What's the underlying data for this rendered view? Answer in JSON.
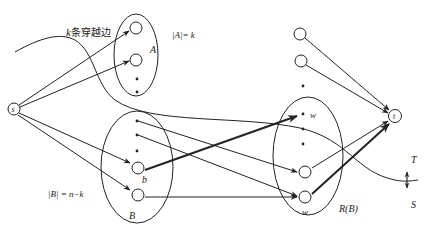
{
  "diagram": {
    "type": "flow-network-cut",
    "labels": {
      "crossing_edges": "k条穿越边",
      "k_prefix": "k",
      "crossing_text": "条穿越边",
      "set_A_size": "|A|= k",
      "set_A": "A",
      "set_B_size": "|B| = n−k",
      "set_B": "B",
      "node_b": "b",
      "node_w_top": "w",
      "node_w_bottom": "w",
      "set_RB": "R(B)",
      "source": "s",
      "sink": "t",
      "side_T": "T",
      "side_S": "S"
    },
    "nodes": [
      {
        "id": "s",
        "label": "s"
      },
      {
        "id": "A1",
        "set": "A"
      },
      {
        "id": "A2",
        "set": "A"
      },
      {
        "id": "B_b",
        "set": "B",
        "label": "b"
      },
      {
        "id": "B_low",
        "set": "B"
      },
      {
        "id": "top1"
      },
      {
        "id": "top2"
      },
      {
        "id": "R_w_dot",
        "set": "R(B)",
        "label": "w"
      },
      {
        "id": "R1",
        "set": "R(B)"
      },
      {
        "id": "R_w",
        "set": "R(B)",
        "label": "w"
      },
      {
        "id": "t",
        "label": "t"
      }
    ],
    "edges": [
      {
        "from": "s",
        "to": "A1"
      },
      {
        "from": "s",
        "to": "A2"
      },
      {
        "from": "s",
        "to": "B_b"
      },
      {
        "from": "s",
        "to": "B_low"
      },
      {
        "from": "B_b",
        "to": "R_w_dot",
        "bold": true
      },
      {
        "from": "B_dot1",
        "to": "R1"
      },
      {
        "from": "B_dot2",
        "to": "R_w"
      },
      {
        "from": "B_low",
        "to": "R_w"
      },
      {
        "from": "top1",
        "to": "t"
      },
      {
        "from": "top2",
        "to": "t"
      },
      {
        "from": "R1",
        "to": "t"
      },
      {
        "from": "R_w",
        "to": "t",
        "bold": true
      }
    ],
    "colors": {
      "stroke": "#222222",
      "background": "#ffffff"
    }
  }
}
